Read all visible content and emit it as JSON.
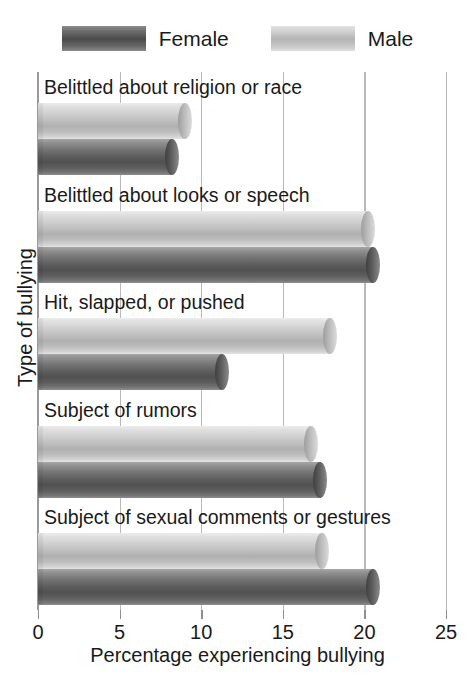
{
  "chart_data": {
    "type": "bar",
    "orientation": "horizontal",
    "title": "",
    "xlabel": "Percentage experiencing bullying",
    "ylabel": "Type of bullying",
    "xlim": [
      0,
      25
    ],
    "xticks": [
      0,
      5,
      10,
      15,
      20,
      25
    ],
    "xtick_labels": [
      "0",
      "5",
      "10",
      "15",
      "20",
      "25"
    ],
    "grid": true,
    "legend_position": "top-center",
    "categories": [
      "Belittled about religion or race",
      "Belittled about looks or speech",
      "Hit, slapped, or pushed",
      "Subject of rumors",
      "Subject of sexual comments or gestures"
    ],
    "series": [
      {
        "name": "Female",
        "color": "#5c5c5c",
        "values": [
          8.2,
          20.5,
          11.3,
          17.3,
          20.5
        ]
      },
      {
        "name": "Male",
        "color": "#bdbdbd",
        "values": [
          9.0,
          20.2,
          17.9,
          16.7,
          17.4
        ]
      }
    ]
  },
  "legend": {
    "items": [
      {
        "label": "Female",
        "swatch": "female-swatch"
      },
      {
        "label": "Male",
        "swatch": "male-swatch"
      }
    ]
  },
  "axis": {
    "x_title": "Percentage experiencing bullying",
    "y_title": "Type of bullying",
    "ticks": [
      "0",
      "5",
      "10",
      "15",
      "20",
      "25"
    ]
  },
  "groups": [
    {
      "label": "Belittled about religion or race",
      "male": 9.0,
      "female": 8.2
    },
    {
      "label": "Belittled about looks or speech",
      "male": 20.2,
      "female": 20.5
    },
    {
      "label": "Hit, slapped, or pushed",
      "male": 17.9,
      "female": 11.3
    },
    {
      "label": "Subject of rumors",
      "male": 16.7,
      "female": 17.3
    },
    {
      "label": "Subject of sexual comments or gestures",
      "male": 17.4,
      "female": 20.5
    }
  ]
}
